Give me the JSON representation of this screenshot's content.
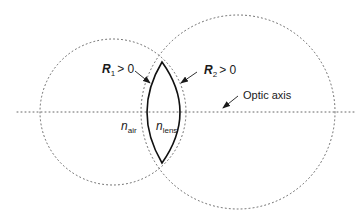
{
  "diagram": {
    "type": "thin lens geometry",
    "labels": {
      "r1": {
        "symbol": "R",
        "subscript": "1",
        "relation": "> 0"
      },
      "r2": {
        "symbol": "R",
        "subscript": "2",
        "relation": "> 0"
      },
      "optic_axis": "Optic axis",
      "n_air": {
        "symbol": "n",
        "subscript": "air"
      },
      "n_lens": {
        "symbol": "n",
        "subscript": "lens"
      }
    },
    "colors": {
      "lens_stroke": "#111111",
      "dotted": "#555555",
      "background": "#ffffff"
    }
  }
}
